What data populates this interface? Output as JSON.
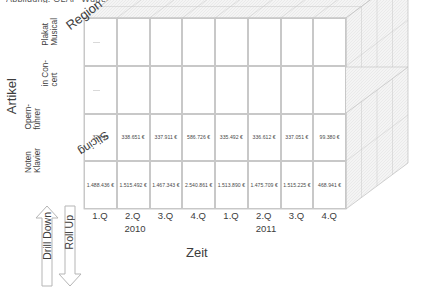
{
  "page": {
    "clipped_heading": "Abbildung: OLAP-Würfel mit Kennzahlen",
    "bg_color": "#ffffff",
    "line_color": "#c8c8c8",
    "text_color": "#3d3d3d"
  },
  "axes": {
    "y_axis_title": "Artikel",
    "y_axis_ticks": [
      {
        "line1": "Noten",
        "line2": "Klavier"
      },
      {
        "line1": "Opern-",
        "line2": "führer"
      },
      {
        "line1": "in Con-",
        "line2": "cert"
      },
      {
        "line1": "Plakat",
        "line2": "Musical"
      }
    ],
    "x_axis_title": "Zeit",
    "x_axis_quarters": [
      "1.Q",
      "2.Q",
      "3.Q",
      "4.Q",
      "1.Q",
      "2.Q",
      "3.Q",
      "4.Q"
    ],
    "x_axis_years": [
      "2010",
      "2011"
    ],
    "depth_axis_title": "Region"
  },
  "annotations": {
    "slicing": "Slicing",
    "drill_down": "Drill Down",
    "roll_up": "Roll Up"
  },
  "chart_data": {
    "type": "table",
    "xlabel": "Zeit",
    "ylabel": "Artikel",
    "zlabel": "Region",
    "categories": [
      "1.Q 2010",
      "2.Q 2010",
      "3.Q 2010",
      "4.Q 2010",
      "1.Q 2011",
      "2.Q 2011",
      "3.Q 2011",
      "4.Q 2011"
    ],
    "row_labels": [
      "Noten Klavier",
      "Opern-führer",
      "in Concert",
      "Plakat Musical"
    ],
    "series": [
      {
        "name": "Noten Klavier",
        "values": [
          "1.488.436 €",
          "1.515.492 €",
          "1.467.343 €",
          "2.540.861 €",
          "1.513.890 €",
          "1.475.709 €",
          "1.515.225 €",
          "468.941 €"
        ]
      },
      {
        "name": "Opern-führer",
        "values": [
          "324.45",
          "338.651 €",
          "337.911 €",
          "586.726 €",
          "335.492 €",
          "336.612 €",
          "337.051 €",
          "99.380 €"
        ]
      },
      {
        "name": "in Concert",
        "values": [
          "",
          "",
          "",
          "",
          "",
          "",
          "",
          ""
        ]
      },
      {
        "name": "Plakat Musical",
        "values": [
          "",
          "",
          "",
          "",
          "",
          "",
          "",
          ""
        ]
      }
    ],
    "grid": true,
    "legend": "none"
  }
}
